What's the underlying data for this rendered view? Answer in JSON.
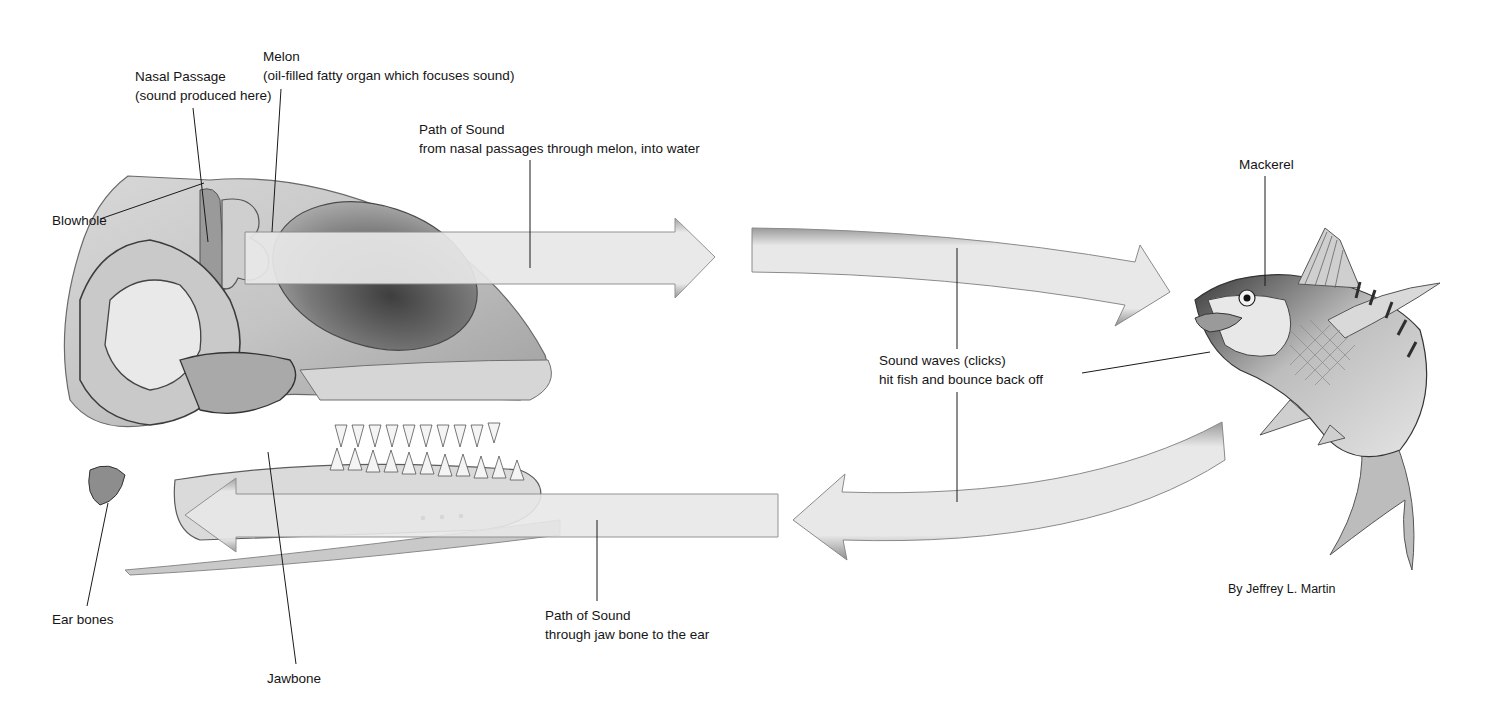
{
  "diagram": {
    "labels": {
      "nasal_passage": {
        "title": "Nasal Passage",
        "detail": "(sound produced here)"
      },
      "melon": {
        "title": "Melon",
        "detail": "(oil-filled fatty organ which focuses sound)"
      },
      "path_out": {
        "title": "Path of Sound",
        "detail": "from nasal passages through melon, into water"
      },
      "blowhole": {
        "title": "Blowhole"
      },
      "mackerel": {
        "title": "Mackerel"
      },
      "sound_waves": {
        "title": "Sound waves (clicks)",
        "detail": "hit fish and bounce back off"
      },
      "ear_bones": {
        "title": "Ear bones"
      },
      "jawbone": {
        "title": "Jawbone"
      },
      "path_in": {
        "title": "Path of Sound",
        "detail": "through jaw bone to the ear"
      },
      "credit": {
        "title": "By Jeffrey L. Martin"
      }
    },
    "colors": {
      "arrow_fill": "#e6e6e6",
      "arrow_edge": "#8a8a8a",
      "ink": "#151515",
      "skull_shade": "#bdbdbd",
      "melon_shade": "#6f6f6f"
    }
  }
}
